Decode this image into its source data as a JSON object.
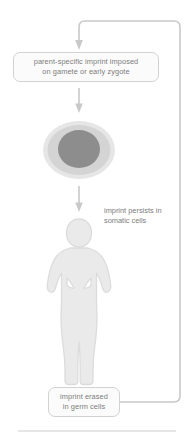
{
  "figure": {
    "width": 194,
    "height": 439
  },
  "nodes": {
    "imprint_imposed": {
      "line1": "parent-specific imprint imposed",
      "line2": "on gamete or early zygote"
    },
    "imprint_erased": {
      "line1": "imprint erased",
      "line2": "in germ cells"
    }
  },
  "annotations": {
    "somatic": {
      "line1": "imprint persists in",
      "line2": "somatic cells"
    }
  },
  "illustrations": {
    "cell": "cell-with-nucleus",
    "person": "human-figure-silhouette"
  },
  "colors": {
    "stroke": "#c9c9c9",
    "box_border": "#d2d2d2",
    "box_fill": "#fbfbfb",
    "text": "#7c7c7c",
    "cell_membrane": "#e3e3e3",
    "cell_cytoplasm": "#cfcfcf",
    "cell_nucleus": "#8a8a8a",
    "person_fill": "#eaeaea",
    "person_stroke": "#dcdcdc",
    "rule": "#dedede"
  }
}
